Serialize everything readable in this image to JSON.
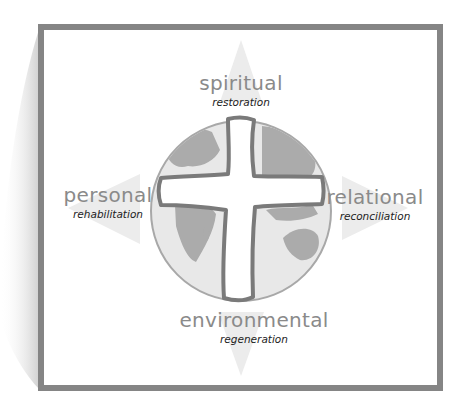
{
  "diagram": {
    "center": {
      "icon": "cross-over-globe"
    },
    "dimensions": [
      {
        "id": "spiritual",
        "label": "spiritual",
        "sublabel": "restoration",
        "direction": "up"
      },
      {
        "id": "personal",
        "label": "personal",
        "sublabel": "rehabilitation",
        "direction": "left"
      },
      {
        "id": "relational",
        "label": "relational",
        "sublabel": "reconciliation",
        "direction": "right"
      },
      {
        "id": "environmental",
        "label": "environmental",
        "sublabel": "regeneration",
        "direction": "down"
      }
    ]
  },
  "colors": {
    "frame": "#858585",
    "label_main": "#8a8a8a",
    "label_sub": "#222222",
    "globe_ocean": "#e6e6e6",
    "globe_land": "#a9a9a9",
    "cross_outline": "#7a7a7a",
    "arrow": "#ececec"
  }
}
